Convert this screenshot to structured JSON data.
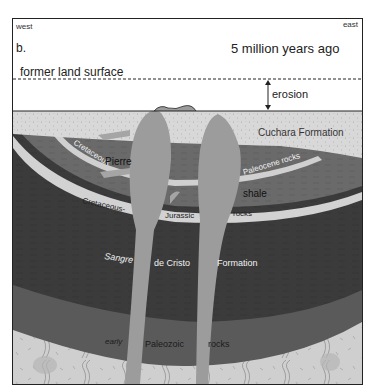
{
  "diagram": {
    "panel_label": "b.",
    "title": "5 million years ago",
    "direction_left": "west",
    "direction_right": "east",
    "former_surface_label": "former land surface",
    "erosion_label": "erosion",
    "layers": {
      "cuchara": "Cuchara Formation",
      "paleocene": "Paleocene rocks",
      "cretaceous_upper": "Cretaceous",
      "pierre": "Pierre",
      "shale": "shale",
      "cretaceous_lower": "Cretaceous-",
      "jurassic": "Jurassic",
      "jurassic_rocks": "rocks",
      "sangre": "Sangre",
      "de_cristo": "de Cristo",
      "formation": "Formation",
      "early": "early",
      "paleozoic": "Paleozoic",
      "paleozoic_rocks": "rocks"
    },
    "colors": {
      "background": "#ffffff",
      "cuchara": "#d6d6d6",
      "paleocene_band": "#cfcfcf",
      "pierre_shale": "#6a6a6a",
      "cretaceous_band": "#d2d2d2",
      "sangre_de_cristo": "#3a3a3a",
      "paleozoic": "#5a5a5a",
      "basement": "#cdcdcd",
      "intrusion": "#9a9a9a",
      "frame": "#222222"
    }
  }
}
